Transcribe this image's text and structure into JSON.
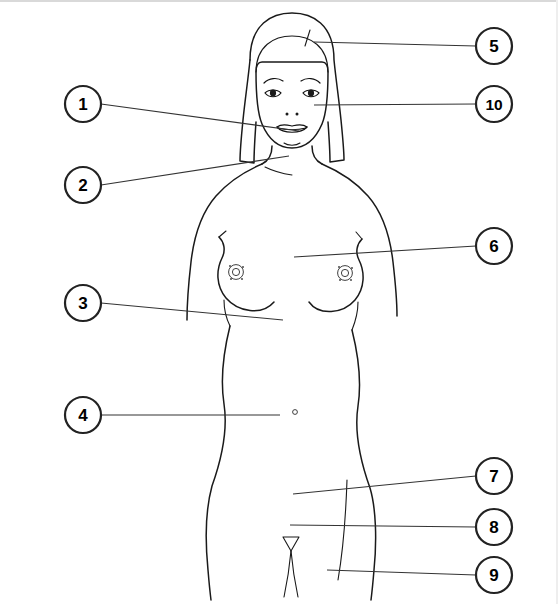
{
  "figure": {
    "stroke_color": "#1a1a1a",
    "background_color": "#ffffff",
    "callout_circle_fill": "#ffffff",
    "callout_circle_stroke": "#222222"
  },
  "callouts": [
    {
      "number": "1",
      "side": "left",
      "circle": {
        "cx": 83,
        "cy": 104,
        "r": 18
      },
      "leader": {
        "x1": 101,
        "y1": 104,
        "x2": 299,
        "y2": 131
      },
      "target": "mouth-lips"
    },
    {
      "number": "2",
      "side": "left",
      "circle": {
        "cx": 83,
        "cy": 185,
        "r": 18
      },
      "leader": {
        "x1": 101,
        "y1": 185,
        "x2": 289,
        "y2": 156
      },
      "target": "shoulder-clavicle"
    },
    {
      "number": "3",
      "side": "left",
      "circle": {
        "cx": 83,
        "cy": 303,
        "r": 18
      },
      "leader": {
        "x1": 101,
        "y1": 303,
        "x2": 283,
        "y2": 320
      },
      "target": "inframammary-fold"
    },
    {
      "number": "4",
      "side": "left",
      "circle": {
        "cx": 83,
        "cy": 415,
        "r": 18
      },
      "leader": {
        "x1": 101,
        "y1": 415,
        "x2": 280,
        "y2": 415
      },
      "target": "navel-umbilicus"
    },
    {
      "number": "5",
      "side": "right",
      "circle": {
        "cx": 494,
        "cy": 46,
        "r": 18
      },
      "leader": {
        "x1": 476,
        "y1": 46,
        "x2": 314,
        "y2": 42
      },
      "target": "hair-scalp"
    },
    {
      "number": "6",
      "side": "right",
      "circle": {
        "cx": 494,
        "cy": 246,
        "r": 18
      },
      "leader": {
        "x1": 476,
        "y1": 246,
        "x2": 294,
        "y2": 257
      },
      "target": "breast-upper-quadrant"
    },
    {
      "number": "7",
      "side": "right",
      "circle": {
        "cx": 494,
        "cy": 476,
        "r": 18
      },
      "leader": {
        "x1": 476,
        "y1": 476,
        "x2": 293,
        "y2": 494
      },
      "target": "hip-groin"
    },
    {
      "number": "8",
      "side": "right",
      "circle": {
        "cx": 494,
        "cy": 527,
        "r": 18
      },
      "leader": {
        "x1": 476,
        "y1": 527,
        "x2": 290,
        "y2": 525
      },
      "target": "pubic-region"
    },
    {
      "number": "9",
      "side": "right",
      "circle": {
        "cx": 494,
        "cy": 575,
        "r": 18
      },
      "leader": {
        "x1": 476,
        "y1": 575,
        "x2": 327,
        "y2": 570
      },
      "target": "inner-thigh"
    },
    {
      "number": "10",
      "side": "right",
      "circle": {
        "cx": 494,
        "cy": 104,
        "r": 18
      },
      "leader": {
        "x1": 476,
        "y1": 104,
        "x2": 314,
        "y2": 105
      },
      "target": "cheek-nose"
    }
  ],
  "anatomy_marks": {
    "navel": {
      "cx": 295,
      "cy": 412,
      "r": 2.4
    },
    "left_areola": {
      "cx": 236,
      "cy": 272,
      "r": 9
    },
    "right_areola": {
      "cx": 345,
      "cy": 273,
      "r": 9
    },
    "pubic_triangle": {
      "apex_x": 291,
      "top_y": 538,
      "bottom_y": 552
    }
  }
}
